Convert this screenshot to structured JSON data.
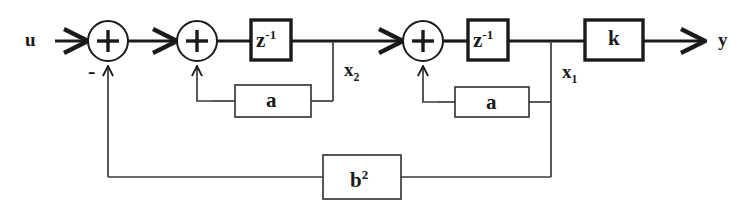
{
  "diagram": {
    "colors": {
      "line": "#1a1a1a",
      "block_border": "#1a1a1a",
      "background": "#ffffff",
      "thin_line": "#3a3a3a"
    },
    "signals": {
      "input_label": "u",
      "output_label": "y",
      "state_2_label": "x",
      "state_2_sub": "2",
      "state_1_label": "x",
      "state_1_sub": "1",
      "negative_sign": "-"
    },
    "summers": [
      {
        "name": "summer-1",
        "symbol": "+",
        "cx": 108,
        "cy": 41,
        "r": 20
      },
      {
        "name": "summer-2",
        "symbol": "+",
        "cx": 197,
        "cy": 41,
        "r": 20
      },
      {
        "name": "summer-3",
        "symbol": "+",
        "cx": 423,
        "cy": 41,
        "r": 20
      }
    ],
    "blocks": [
      {
        "name": "delay-block-1",
        "label": "z",
        "sup": "-1",
        "x": 251,
        "y": 20,
        "w": 40,
        "h": 40
      },
      {
        "name": "gain-block-a-1",
        "label": "a",
        "sup": "",
        "x": 235,
        "y": 85,
        "w": 76,
        "h": 32
      },
      {
        "name": "delay-block-2",
        "label": "z",
        "sup": "-1",
        "x": 468,
        "y": 20,
        "w": 40,
        "h": 40
      },
      {
        "name": "gain-block-a-2",
        "label": "a",
        "sup": "",
        "x": 455,
        "y": 87,
        "w": 74,
        "h": 30
      },
      {
        "name": "gain-block-k",
        "label": "k",
        "sup": "",
        "x": 585,
        "y": 20,
        "w": 58,
        "h": 40
      },
      {
        "name": "gain-block-b-squared",
        "label": "b",
        "sup": "2",
        "x": 323,
        "y": 155,
        "w": 78,
        "h": 44
      }
    ]
  }
}
